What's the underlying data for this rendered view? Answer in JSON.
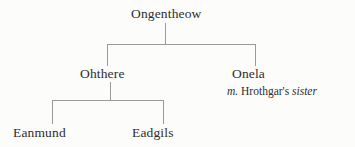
{
  "diagram": {
    "type": "family-tree",
    "title": "",
    "colors": {
      "background": "#fcfcfb",
      "line": "#9a9a9a",
      "text": "#2e2e2e"
    },
    "nodes": {
      "ongentheow": {
        "label": "Ongentheow",
        "generation": 1
      },
      "ohthere": {
        "label": "Ohthere",
        "generation": 2
      },
      "onela": {
        "label": "Onela",
        "generation": 2
      },
      "eanmund": {
        "label": "Eanmund",
        "generation": 3
      },
      "eadgils": {
        "label": "Eadgils",
        "generation": 3
      }
    },
    "annotations": {
      "onela_marriage": {
        "marker": "m.",
        "spouse": "Hrothgar's",
        "relation": "sister"
      }
    },
    "edges": [
      {
        "from": "ongentheow",
        "to": "ohthere"
      },
      {
        "from": "ongentheow",
        "to": "onela"
      },
      {
        "from": "ohthere",
        "to": "eanmund"
      },
      {
        "from": "ohthere",
        "to": "eadgils"
      }
    ]
  }
}
